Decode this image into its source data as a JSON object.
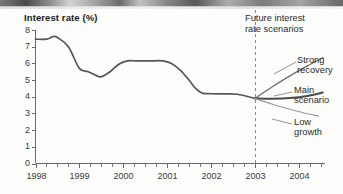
{
  "figure": {
    "title": "Interest rate (%)",
    "divider_note_line1": "Future interest",
    "divider_note_line2": "rate scenarios",
    "scenario_labels": {
      "strong_line1": "Strong",
      "strong_line2": "recovery",
      "main_line1": "Main",
      "main_line2": "scenario",
      "low_line1": "Low",
      "low_line2": "growth"
    },
    "colors": {
      "historical_line": "#555555",
      "main_scenario_line": "#4a4a4a",
      "strong_recovery_line": "#6a6a6a",
      "low_growth_line": "#9a9a9a",
      "axis": "#6b6b6b",
      "divider": "#8a8a8a",
      "text": "#2a2a28"
    }
  },
  "chart_data": {
    "type": "line",
    "title": "Interest rate (%)",
    "xlabel": "",
    "ylabel": "Interest rate (%)",
    "xlim": [
      1998.0,
      2004.6
    ],
    "ylim": [
      0,
      8
    ],
    "grid": false,
    "legend": "annotations-right",
    "y_ticks": [
      0,
      1,
      2,
      3,
      4,
      5,
      6,
      7,
      8
    ],
    "x_ticks": [
      1998,
      1999,
      2000,
      2001,
      2002,
      2003,
      2004
    ],
    "x_tick_labels": [
      "1998",
      "1999",
      "2000",
      "2001",
      "2002",
      "2003",
      "2004"
    ],
    "x_minor_tick_interval": 0.25,
    "forecast_divider_x": 2003.0,
    "annotations": [
      {
        "text": "Future interest rate scenarios",
        "x": 2003.1,
        "y": 7.7
      },
      {
        "text": "Strong recovery",
        "x": 2004.7,
        "y": 6.0
      },
      {
        "text": "Main scenario",
        "x": 2004.7,
        "y": 4.3
      },
      {
        "text": "Low growth",
        "x": 2004.7,
        "y": 2.9
      }
    ],
    "series": [
      {
        "name": "Historical interest rate",
        "style": "solid",
        "color": "#555555",
        "x": [
          1998.0,
          1998.25,
          1998.4,
          1998.5,
          1998.75,
          1999.0,
          1999.2,
          1999.4,
          1999.5,
          1999.7,
          1999.9,
          2000.1,
          2000.3,
          2000.6,
          2000.9,
          2001.1,
          2001.3,
          2001.5,
          2001.65,
          2001.8,
          2002.0,
          2002.3,
          2002.6,
          2003.0
        ],
        "y": [
          7.45,
          7.45,
          7.6,
          7.55,
          7.0,
          5.7,
          5.5,
          5.25,
          5.2,
          5.5,
          5.95,
          6.15,
          6.15,
          6.15,
          6.15,
          6.0,
          5.6,
          5.0,
          4.5,
          4.22,
          4.18,
          4.17,
          4.15,
          3.9
        ]
      },
      {
        "name": "Strong recovery",
        "style": "solid",
        "color": "#6a6a6a",
        "x": [
          2003.0,
          2003.4,
          2003.8,
          2004.2,
          2004.55
        ],
        "y": [
          3.9,
          4.6,
          5.25,
          5.85,
          6.35
        ]
      },
      {
        "name": "Main scenario",
        "style": "solid",
        "color": "#4a4a4a",
        "x": [
          2003.0,
          2003.4,
          2003.8,
          2004.2,
          2004.55
        ],
        "y": [
          3.9,
          3.88,
          3.92,
          4.05,
          4.25
        ]
      },
      {
        "name": "Low growth",
        "style": "solid",
        "color": "#9a9a9a",
        "x": [
          2003.0,
          2003.4,
          2003.8,
          2004.2,
          2004.45
        ],
        "y": [
          3.9,
          3.55,
          3.25,
          2.98,
          2.85
        ]
      }
    ]
  }
}
